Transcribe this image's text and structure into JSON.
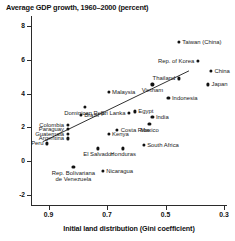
{
  "chart_data": {
    "type": "scatter",
    "title": "Average GDP growth, 1960–2000 (percent)",
    "xlabel": "Initial land distribution (Gini coefficient)",
    "ylabel": "",
    "xlim": [
      0.96,
      0.29
    ],
    "ylim": [
      -2.6,
      8.6
    ],
    "x_reversed": true,
    "grid": false,
    "legend": "none",
    "xticks": [
      "0.9",
      "0.7",
      "0.5",
      "0.3"
    ],
    "xtick_values": [
      0.9,
      0.7,
      0.5,
      0.3
    ],
    "yticks": [
      "8",
      "6",
      "4",
      "2",
      "0",
      "-2"
    ],
    "ytick_values": [
      8,
      6,
      4,
      2,
      0,
      -2
    ],
    "trendline": {
      "x0": 0.92,
      "y0": 1.15,
      "x1": 0.42,
      "y1": 5.35
    },
    "points": [
      {
        "name": "Taiwan (China)",
        "x": 0.455,
        "y": 7.05,
        "label_pos": "lr"
      },
      {
        "name": "Rep. of Korea",
        "x": 0.39,
        "y": 5.95,
        "label_pos": "rl"
      },
      {
        "name": "China",
        "x": 0.345,
        "y": 5.35,
        "label_pos": "lr"
      },
      {
        "name": "Thailand",
        "x": 0.455,
        "y": 4.9,
        "label_pos": "rl"
      },
      {
        "name": "Japan",
        "x": 0.355,
        "y": 4.55,
        "label_pos": "lr"
      },
      {
        "name": "Vietnam",
        "x": 0.545,
        "y": 4.55,
        "label_pos": "ctr"
      },
      {
        "name": "Malaysia",
        "x": 0.695,
        "y": 4.1,
        "label_pos": "lr"
      },
      {
        "name": "Indonesia",
        "x": 0.49,
        "y": 3.75,
        "label_pos": "lr"
      },
      {
        "name": "Dominican Rep.",
        "x": 0.775,
        "y": 3.2,
        "label_pos": "ctr"
      },
      {
        "name": "Sri Lanka",
        "x": 0.625,
        "y": 2.85,
        "label_pos": "rl"
      },
      {
        "name": "Egypt",
        "x": 0.605,
        "y": 2.95,
        "label_pos": "lr"
      },
      {
        "name": "Brazil",
        "x": 0.79,
        "y": 2.75,
        "label_pos": "lr"
      },
      {
        "name": "India",
        "x": 0.545,
        "y": 2.6,
        "label_pos": "lr"
      },
      {
        "name": "Mexico",
        "x": 0.555,
        "y": 2.2,
        "label_pos": "ctr"
      },
      {
        "name": "Colombia",
        "x": 0.835,
        "y": 2.15,
        "label_pos": "rl"
      },
      {
        "name": "Paraguay",
        "x": 0.835,
        "y": 1.9,
        "label_pos": "rl"
      },
      {
        "name": "Costa Rica",
        "x": 0.665,
        "y": 1.85,
        "label_pos": "lr"
      },
      {
        "name": "Guatemala",
        "x": 0.835,
        "y": 1.6,
        "label_pos": "rl"
      },
      {
        "name": "Kenya",
        "x": 0.695,
        "y": 1.6,
        "label_pos": "lr"
      },
      {
        "name": "Argentina",
        "x": 0.835,
        "y": 1.35,
        "label_pos": "rl"
      },
      {
        "name": "Peru",
        "x": 0.905,
        "y": 1.05,
        "label_pos": "rl"
      },
      {
        "name": "South Africa",
        "x": 0.575,
        "y": 0.95,
        "label_pos": "lr"
      },
      {
        "name": "El Salvador",
        "x": 0.73,
        "y": 0.75,
        "label_pos": "ctr"
      },
      {
        "name": "Honduras",
        "x": 0.645,
        "y": 0.75,
        "label_pos": "ctr"
      },
      {
        "name": "Rep. Bolivariana de Venezuela",
        "x": 0.815,
        "y": -0.35,
        "label_pos": "ctr"
      },
      {
        "name": "Nicaragua",
        "x": 0.715,
        "y": -0.6,
        "label_pos": "lr"
      }
    ]
  }
}
